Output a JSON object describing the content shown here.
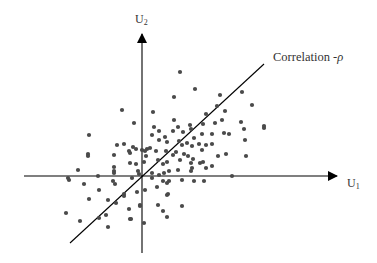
{
  "diagram": {
    "title": "",
    "axes": {
      "x": {
        "label": "U",
        "subscript": "1"
      },
      "y": {
        "label": "U",
        "subscript": "2"
      }
    },
    "line_label": {
      "text": "Correlation -",
      "symbol": "ρ"
    },
    "colors": {
      "axis": "#000000",
      "dot": "#4a4a4a",
      "text": "#333333",
      "background": "#ffffff"
    }
  },
  "chart_data": {
    "type": "scatter",
    "title": "",
    "xlabel": "U1",
    "ylabel": "U2",
    "annotations": [
      "Correlation -ρ"
    ],
    "grid": false,
    "legend": "none",
    "regression_line": {
      "from": [
        -72,
        -67
      ],
      "to": [
        122,
        112
      ]
    },
    "points_px_relative_to_origin": [
      [
        38,
        -104
      ],
      [
        53,
        -87
      ],
      [
        32,
        -79
      ],
      [
        78,
        -81
      ],
      [
        100,
        -84
      ],
      [
        75,
        -70
      ],
      [
        110,
        -71
      ],
      [
        83,
        -65
      ],
      [
        32,
        -56
      ],
      [
        64,
        -62
      ],
      [
        80,
        -56
      ],
      [
        99,
        -54
      ],
      [
        -20,
        -66
      ],
      [
        -8,
        -53
      ],
      [
        11,
        -64
      ],
      [
        12,
        -49
      ],
      [
        36,
        -49
      ],
      [
        48,
        -51
      ],
      [
        61,
        -52
      ],
      [
        73,
        -53
      ],
      [
        102,
        -47
      ],
      [
        122,
        -48
      ],
      [
        122,
        -50
      ],
      [
        10,
        -41
      ],
      [
        17,
        -45
      ],
      [
        31,
        -45
      ],
      [
        41,
        -44
      ],
      [
        49,
        -47
      ],
      [
        60,
        -42
      ],
      [
        70,
        -42
      ],
      [
        82,
        -43
      ],
      [
        87,
        -42
      ],
      [
        103,
        -36
      ],
      [
        52,
        -38
      ],
      [
        -53,
        -41
      ],
      [
        -25,
        -31
      ],
      [
        -18,
        -32
      ],
      [
        -9,
        -29
      ],
      [
        -6,
        -27
      ],
      [
        5,
        -27
      ],
      [
        17,
        -36
      ],
      [
        23,
        -39
      ],
      [
        25,
        -34
      ],
      [
        37,
        -35
      ],
      [
        40,
        -31
      ],
      [
        45,
        -33
      ],
      [
        50,
        -30
      ],
      [
        57,
        -32
      ],
      [
        64,
        -31
      ],
      [
        70,
        -32
      ],
      [
        -54,
        -22
      ],
      [
        -54,
        -20
      ],
      [
        -28,
        -21
      ],
      [
        -13,
        -25
      ],
      [
        -12,
        -23
      ],
      [
        0,
        -26
      ],
      [
        3,
        -25
      ],
      [
        4,
        -20
      ],
      [
        8,
        -28
      ],
      [
        14,
        -25
      ],
      [
        24,
        -25
      ],
      [
        31,
        -21
      ],
      [
        34,
        -24
      ],
      [
        42,
        -22
      ],
      [
        46,
        -20
      ],
      [
        60,
        -26
      ],
      [
        76,
        -20
      ],
      [
        84,
        -22
      ],
      [
        104,
        -20
      ],
      [
        -28,
        -9
      ],
      [
        -12,
        -13
      ],
      [
        -6,
        -12
      ],
      [
        2,
        -14
      ],
      [
        16,
        -16
      ],
      [
        21,
        -12
      ],
      [
        25,
        -14
      ],
      [
        38,
        -16
      ],
      [
        49,
        -13
      ],
      [
        51,
        -17
      ],
      [
        58,
        -13
      ],
      [
        61,
        -14
      ],
      [
        -64,
        -6
      ],
      [
        -28,
        -5
      ],
      [
        -28,
        -3
      ],
      [
        -4,
        -5
      ],
      [
        10,
        -3
      ],
      [
        17,
        -1
      ],
      [
        22,
        -3
      ],
      [
        27,
        -5
      ],
      [
        36,
        -6
      ],
      [
        49,
        -5
      ],
      [
        50,
        -8
      ],
      [
        64,
        -8
      ],
      [
        70,
        -10
      ],
      [
        -74,
        2
      ],
      [
        -73,
        4
      ],
      [
        -44,
        0
      ],
      [
        -58,
        8
      ],
      [
        -29,
        5
      ],
      [
        -27,
        8
      ],
      [
        -10,
        2
      ],
      [
        -3,
        -2
      ],
      [
        10,
        2
      ],
      [
        21,
        5
      ],
      [
        25,
        7
      ],
      [
        27,
        5
      ],
      [
        40,
        4
      ],
      [
        52,
        5
      ],
      [
        90,
        0
      ],
      [
        62,
        5
      ],
      [
        -43,
        14
      ],
      [
        -18,
        18
      ],
      [
        -18,
        20
      ],
      [
        -5,
        16
      ],
      [
        3,
        14
      ],
      [
        15,
        11
      ],
      [
        25,
        19
      ],
      [
        26,
        18
      ],
      [
        -53,
        23
      ],
      [
        -34,
        24
      ],
      [
        -26,
        27
      ],
      [
        -36,
        39
      ],
      [
        -13,
        33
      ],
      [
        -2,
        29
      ],
      [
        -2,
        30
      ],
      [
        16,
        29
      ],
      [
        21,
        35
      ],
      [
        40,
        30
      ],
      [
        -76,
        37
      ],
      [
        -62,
        45
      ],
      [
        -43,
        42
      ],
      [
        -12,
        43
      ],
      [
        -11,
        43
      ],
      [
        2,
        47
      ],
      [
        25,
        41
      ],
      [
        -34,
        51
      ]
    ]
  }
}
